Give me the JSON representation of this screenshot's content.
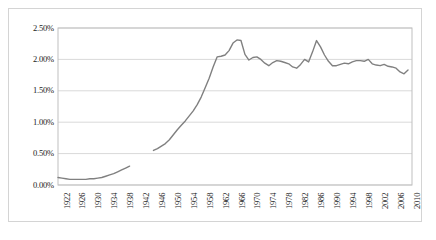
{
  "chart_data": {
    "type": "line",
    "title": "",
    "xlabel": "",
    "ylabel": "",
    "grid": true,
    "legend": "none",
    "line_color": "#808080",
    "gridline_color": "#d9d9d9",
    "plot_border_color": "#bfbfbf",
    "frame_border_color": "#d4d4d4",
    "ylim": [
      0.0,
      2.5
    ],
    "ytick_values": [
      0.0,
      0.5,
      1.0,
      1.5,
      2.0,
      2.5
    ],
    "ytick_labels": [
      "0.00%",
      "0.50%",
      "1.00%",
      "1.50%",
      "2.00%",
      "2.50%"
    ],
    "xlim": [
      1922,
      2011
    ],
    "xtick_labels": [
      "1922",
      "1926",
      "1930",
      "1934",
      "1938",
      "1942",
      "1946",
      "1950",
      "1954",
      "1958",
      "1962",
      "1966",
      "1970",
      "1974",
      "1978",
      "1982",
      "1986",
      "1990",
      "1994",
      "1998",
      "2002",
      "2006",
      "2010"
    ],
    "xtick_values": [
      1922,
      1926,
      1930,
      1934,
      1938,
      1942,
      1946,
      1950,
      1954,
      1958,
      1962,
      1966,
      1970,
      1974,
      1978,
      1982,
      1986,
      1990,
      1994,
      1998,
      2002,
      2006,
      2010
    ],
    "series": [
      {
        "name": "series-1-prewar",
        "x": [
          1922,
          1923,
          1924,
          1925,
          1926,
          1927,
          1928,
          1929,
          1930,
          1931,
          1932,
          1933,
          1934,
          1935,
          1936,
          1937,
          1938,
          1939,
          1940
        ],
        "values": [
          0.12,
          0.11,
          0.1,
          0.09,
          0.09,
          0.09,
          0.09,
          0.09,
          0.1,
          0.1,
          0.11,
          0.12,
          0.14,
          0.16,
          0.18,
          0.21,
          0.24,
          0.27,
          0.3
        ]
      },
      {
        "name": "series-2-postwar",
        "x": [
          1946,
          1947,
          1948,
          1949,
          1950,
          1951,
          1952,
          1953,
          1954,
          1955,
          1956,
          1957,
          1958,
          1959,
          1960,
          1961,
          1962,
          1963,
          1964,
          1965,
          1966,
          1967,
          1968,
          1969,
          1970,
          1971,
          1972,
          1973,
          1974,
          1975,
          1976,
          1977,
          1978,
          1979,
          1980,
          1981,
          1982,
          1983,
          1984,
          1985,
          1986,
          1987,
          1988,
          1989,
          1990,
          1991,
          1992,
          1993,
          1994,
          1995,
          1996,
          1997,
          1998,
          1999,
          2000,
          2001,
          2002,
          2003,
          2004,
          2005,
          2006,
          2007,
          2008,
          2009,
          2010
        ],
        "values": [
          0.55,
          0.58,
          0.62,
          0.66,
          0.72,
          0.8,
          0.88,
          0.95,
          1.02,
          1.1,
          1.18,
          1.28,
          1.4,
          1.55,
          1.7,
          1.88,
          2.04,
          2.05,
          2.07,
          2.14,
          2.26,
          2.31,
          2.3,
          2.08,
          1.99,
          2.03,
          2.04,
          2.0,
          1.94,
          1.9,
          1.95,
          1.98,
          1.97,
          1.95,
          1.93,
          1.88,
          1.86,
          1.92,
          2.0,
          1.96,
          2.12,
          2.3,
          2.2,
          2.07,
          1.97,
          1.9,
          1.9,
          1.92,
          1.94,
          1.93,
          1.96,
          1.98,
          1.98,
          1.97,
          2.0,
          1.93,
          1.91,
          1.9,
          1.92,
          1.89,
          1.88,
          1.86,
          1.8,
          1.77,
          1.83
        ]
      }
    ]
  }
}
